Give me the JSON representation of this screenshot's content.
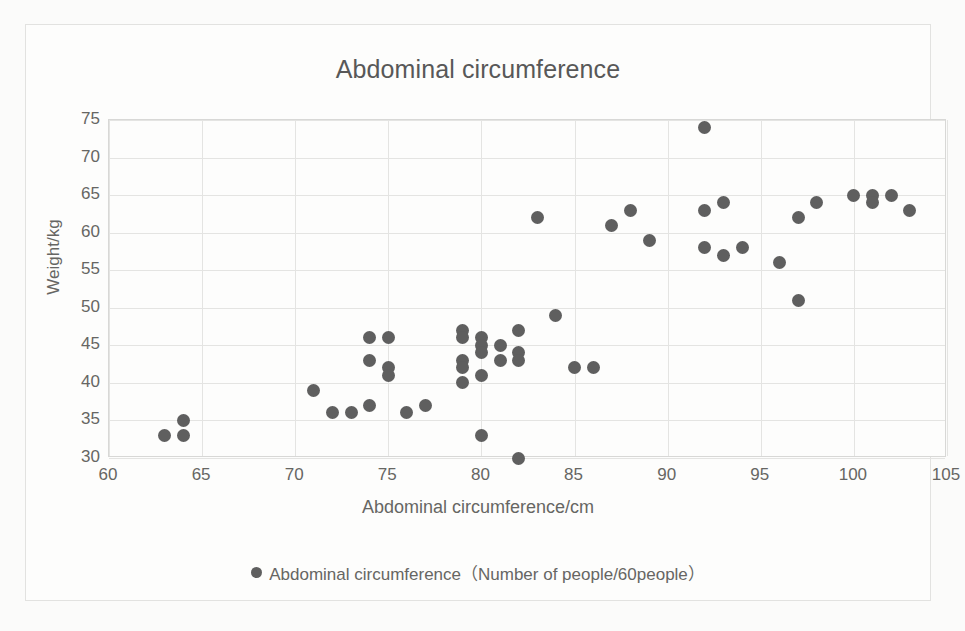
{
  "card": {
    "background_color": "#fdfdfc",
    "border_color": "#e2e2e0"
  },
  "chart_data": {
    "type": "scatter",
    "title": "Abdominal circumference",
    "xlabel": "Abdominal circumference/cm",
    "ylabel": "Weight/kg",
    "xlim": [
      60,
      105
    ],
    "ylim": [
      30,
      75
    ],
    "xticks": [
      60,
      65,
      70,
      75,
      80,
      85,
      90,
      95,
      100,
      105
    ],
    "yticks": [
      30,
      35,
      40,
      45,
      50,
      55,
      60,
      65,
      70,
      75
    ],
    "grid": true,
    "legend_position": "bottom",
    "marker_color": "#5f5f5f",
    "series": [
      {
        "name": "Abdominal circumference（Number of people/60people）",
        "points": [
          [
            63,
            33
          ],
          [
            64,
            35
          ],
          [
            64,
            33
          ],
          [
            71,
            39
          ],
          [
            72,
            36
          ],
          [
            73,
            36
          ],
          [
            74,
            43
          ],
          [
            74,
            46
          ],
          [
            74,
            37
          ],
          [
            75,
            46
          ],
          [
            75,
            42
          ],
          [
            75,
            41
          ],
          [
            76,
            36
          ],
          [
            77,
            37
          ],
          [
            79,
            47
          ],
          [
            79,
            46
          ],
          [
            79,
            43
          ],
          [
            79,
            42
          ],
          [
            79,
            40
          ],
          [
            80,
            46
          ],
          [
            80,
            45
          ],
          [
            80,
            44
          ],
          [
            80,
            41
          ],
          [
            80,
            33
          ],
          [
            81,
            45
          ],
          [
            81,
            43
          ],
          [
            82,
            47
          ],
          [
            82,
            44
          ],
          [
            82,
            43
          ],
          [
            82,
            30
          ],
          [
            83,
            62
          ],
          [
            84,
            49
          ],
          [
            85,
            42
          ],
          [
            86,
            42
          ],
          [
            87,
            61
          ],
          [
            88,
            63
          ],
          [
            89,
            59
          ],
          [
            92,
            74
          ],
          [
            92,
            63
          ],
          [
            92,
            58
          ],
          [
            93,
            64
          ],
          [
            93,
            57
          ],
          [
            94,
            58
          ],
          [
            96,
            56
          ],
          [
            97,
            62
          ],
          [
            97,
            51
          ],
          [
            98,
            64
          ],
          [
            100,
            65
          ],
          [
            101,
            65
          ],
          [
            101,
            64
          ],
          [
            102,
            65
          ],
          [
            103,
            63
          ]
        ]
      }
    ]
  },
  "legend": {
    "marker": "filled-circle",
    "label": "Abdominal circumference（Number of people/60people）"
  }
}
